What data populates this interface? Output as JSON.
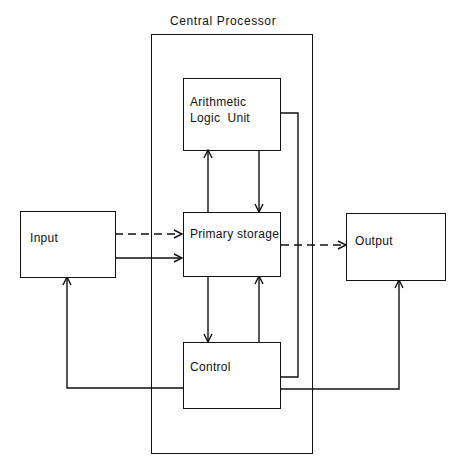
{
  "diagram": {
    "title": "Central Processor",
    "nodes": {
      "alu": {
        "line1": "Arithmetic",
        "line2": "Logic  Unit"
      },
      "primary_storage": {
        "label": "Primary storage"
      },
      "control": {
        "label": "Control"
      },
      "input": {
        "label": "Input"
      },
      "output": {
        "label": "Output"
      }
    },
    "edges": [
      {
        "from": "input",
        "to": "primary_storage",
        "style": "dashed",
        "meaning": "data"
      },
      {
        "from": "input",
        "to": "primary_storage",
        "style": "solid"
      },
      {
        "from": "primary_storage",
        "to": "output",
        "style": "dashed",
        "meaning": "data"
      },
      {
        "from": "primary_storage",
        "to": "alu",
        "style": "solid"
      },
      {
        "from": "alu",
        "to": "primary_storage",
        "style": "solid"
      },
      {
        "from": "primary_storage",
        "to": "control",
        "style": "solid"
      },
      {
        "from": "control",
        "to": "primary_storage",
        "style": "solid"
      },
      {
        "from": "control",
        "to": "alu",
        "style": "solid"
      },
      {
        "from": "control",
        "to": "input",
        "style": "solid"
      },
      {
        "from": "control",
        "to": "output",
        "style": "solid"
      }
    ],
    "colors": {
      "line": "#111111",
      "background": "#ffffff"
    }
  }
}
